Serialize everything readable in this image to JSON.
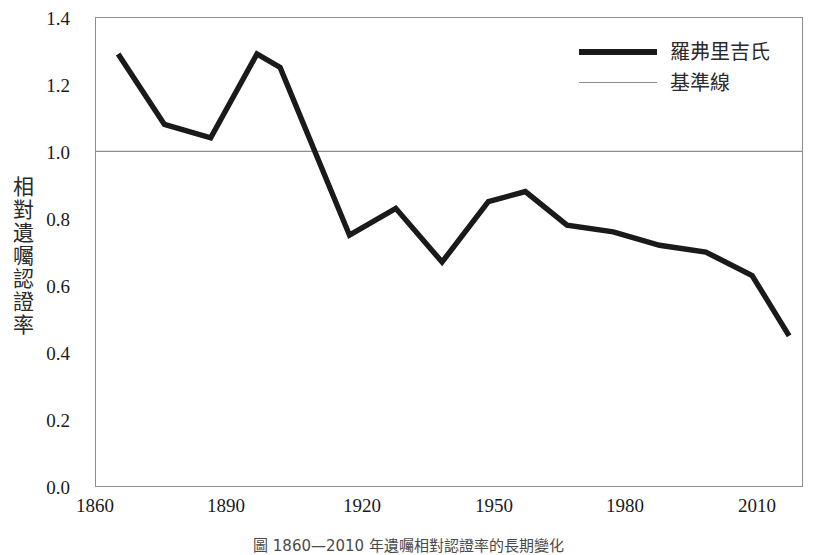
{
  "figure": {
    "y_axis_title": "相對遺囑認證率",
    "caption": "圖 1860—2010 年遺囑相對認證率的長期變化"
  },
  "legend": {
    "position": "top-right",
    "entries": [
      {
        "label": "羅弗里吉氏",
        "style": "thick-solid",
        "color": "#1a1a1a"
      },
      {
        "label": "基準線",
        "style": "thin-solid",
        "color": "#8d8d8d"
      }
    ]
  },
  "chart_data": {
    "type": "line",
    "title": "",
    "xlabel": "",
    "ylabel": "相對遺囑認證率",
    "xlim": [
      1860,
      2013
    ],
    "ylim": [
      0.0,
      1.4
    ],
    "grid": false,
    "legend_position": "top-right",
    "x_ticks": [
      1860,
      1890,
      1920,
      1950,
      1980,
      2010
    ],
    "y_ticks": [
      "0.0",
      "0.2",
      "0.4",
      "0.6",
      "0.8",
      "1.0",
      "1.2",
      "1.4"
    ],
    "y_tick_values": [
      0.0,
      0.2,
      0.4,
      0.6,
      0.8,
      1.0,
      1.2,
      1.4
    ],
    "reference_line": {
      "name": "基準線",
      "value": 1.0,
      "color": "#8d8d8d"
    },
    "series": [
      {
        "name": "羅弗里吉氏",
        "color": "#1a1a1a",
        "x": [
          1865,
          1875,
          1885,
          1895,
          1900,
          1915,
          1925,
          1935,
          1945,
          1953,
          1962,
          1972,
          1982,
          1992,
          2002,
          2010
        ],
        "values": [
          1.29,
          1.08,
          1.04,
          1.29,
          1.25,
          0.75,
          0.83,
          0.67,
          0.85,
          0.88,
          0.78,
          0.76,
          0.72,
          0.7,
          0.63,
          0.45
        ]
      }
    ]
  }
}
